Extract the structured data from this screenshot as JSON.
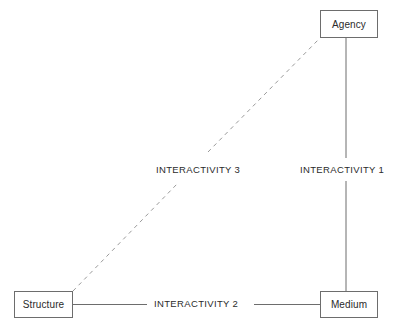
{
  "diagram": {
    "stroke_color": "#6d6d6d",
    "text_color": "#2b2b2b",
    "background_color": "#ffffff",
    "nodes": [
      {
        "id": "agency",
        "label": "Agency"
      },
      {
        "id": "structure",
        "label": "Structure"
      },
      {
        "id": "medium",
        "label": "Medium"
      }
    ],
    "edges": [
      {
        "id": "interactivity-1",
        "label": "INTERACTIVITY 1",
        "from": "agency",
        "to": "medium",
        "style": "solid",
        "orientation": "vertical"
      },
      {
        "id": "interactivity-2",
        "label": "INTERACTIVITY 2",
        "from": "structure",
        "to": "medium",
        "style": "solid",
        "orientation": "horizontal"
      },
      {
        "id": "interactivity-3",
        "label": "INTERACTIVITY 3",
        "from": "structure",
        "to": "agency",
        "style": "dashed",
        "orientation": "diagonal"
      }
    ]
  }
}
